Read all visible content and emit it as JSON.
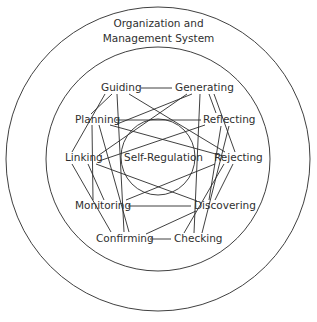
{
  "title": {
    "line1": "Organization and",
    "line2": "Management System"
  },
  "center": {
    "label": "Self-Regulation"
  },
  "nodes": {
    "guiding": "Guiding",
    "generating": "Generating",
    "planning": "Planning",
    "reflecting": "Reflecting",
    "linking": "Linking",
    "rejecting": "Rejecting",
    "monitoring": "Monitoring",
    "discovering": "Discovering",
    "confirming": "Confirming",
    "checking": "Checking"
  },
  "rings": [
    {
      "name": "outer-ring",
      "cx": 158,
      "cy": 159,
      "r": 152
    },
    {
      "name": "middle-ring",
      "cx": 158,
      "cy": 159,
      "r": 112
    },
    {
      "name": "inner-ring",
      "cx": 158,
      "cy": 157,
      "r": 37
    }
  ],
  "edges": [
    {
      "from": "Guiding",
      "to": "Generating",
      "x1": 141,
      "y1": 88,
      "x2": 172,
      "y2": 88
    },
    {
      "from": "Planning",
      "to": "Reflecting",
      "x1": 116,
      "y1": 120,
      "x2": 201,
      "y2": 120
    },
    {
      "from": "Monitoring",
      "to": "Discovering",
      "x1": 128,
      "y1": 206,
      "x2": 191,
      "y2": 206
    },
    {
      "from": "Confirming",
      "to": "Checking",
      "x1": 150,
      "y1": 239,
      "x2": 171,
      "y2": 239
    },
    {
      "from": "Guiding",
      "to": "Planning",
      "x1": 112,
      "y1": 94,
      "x2": 91,
      "y2": 114
    },
    {
      "from": "Guiding",
      "to": "Linking",
      "x1": 105,
      "y1": 94,
      "x2": 72,
      "y2": 152
    },
    {
      "from": "Guiding",
      "to": "Confirming",
      "x1": 117,
      "y1": 94,
      "x2": 124,
      "y2": 232
    },
    {
      "from": "Guiding",
      "to": "Rejecting",
      "x1": 129,
      "y1": 94,
      "x2": 225,
      "y2": 152
    },
    {
      "from": "Generating",
      "to": "Planning",
      "x1": 192,
      "y1": 94,
      "x2": 117,
      "y2": 124
    },
    {
      "from": "Generating",
      "to": "Linking",
      "x1": 187,
      "y1": 94,
      "x2": 99,
      "y2": 155
    },
    {
      "from": "Generating",
      "to": "Checking",
      "x1": 200,
      "y1": 94,
      "x2": 194,
      "y2": 233
    },
    {
      "from": "Generating",
      "to": "Reflecting",
      "x1": 209,
      "y1": 94,
      "x2": 216,
      "y2": 113
    },
    {
      "from": "Generating",
      "to": "Rejecting",
      "x1": 214,
      "y1": 94,
      "x2": 235,
      "y2": 152
    },
    {
      "from": "Planning",
      "to": "Rejecting",
      "x1": 110,
      "y1": 125,
      "x2": 223,
      "y2": 156
    },
    {
      "from": "Planning",
      "to": "Monitoring",
      "x1": 92,
      "y1": 125,
      "x2": 93,
      "y2": 200
    },
    {
      "from": "Planning",
      "to": "Confirming",
      "x1": 99,
      "y1": 125,
      "x2": 129,
      "y2": 232
    },
    {
      "from": "Reflecting",
      "to": "Linking",
      "x1": 205,
      "y1": 125,
      "x2": 99,
      "y2": 161
    },
    {
      "from": "Reflecting",
      "to": "Discovering",
      "x1": 221,
      "y1": 126,
      "x2": 209,
      "y2": 200
    },
    {
      "from": "Reflecting",
      "to": "Checking",
      "x1": 229,
      "y1": 126,
      "x2": 202,
      "y2": 233
    },
    {
      "from": "Linking",
      "to": "Discovering",
      "x1": 96,
      "y1": 164,
      "x2": 197,
      "y2": 201
    },
    {
      "from": "Linking",
      "to": "Confirming",
      "x1": 72,
      "y1": 164,
      "x2": 111,
      "y2": 232
    },
    {
      "from": "Linking",
      "to": "Monitoring",
      "x1": 88,
      "y1": 164,
      "x2": 104,
      "y2": 200
    },
    {
      "from": "Rejecting",
      "to": "Monitoring",
      "x1": 215,
      "y1": 164,
      "x2": 126,
      "y2": 200
    },
    {
      "from": "Rejecting",
      "to": "Checking",
      "x1": 224,
      "y1": 164,
      "x2": 184,
      "y2": 233
    },
    {
      "from": "Rejecting",
      "to": "Discovering",
      "x1": 233,
      "y1": 164,
      "x2": 215,
      "y2": 200
    },
    {
      "from": "Discovering",
      "to": "Confirming",
      "x1": 196,
      "y1": 211,
      "x2": 146,
      "y2": 234
    }
  ],
  "colors": {
    "stroke": "#2a2a2a",
    "text": "#2f2f2f",
    "background": "#ffffff"
  }
}
